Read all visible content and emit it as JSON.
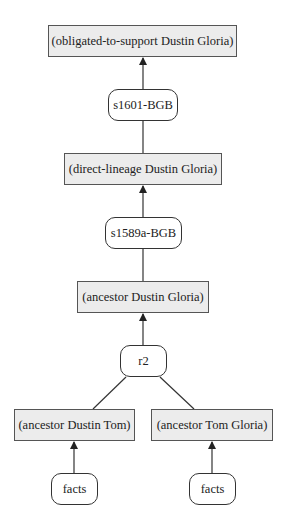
{
  "diagram": {
    "type": "argument-graph",
    "nodes": [
      {
        "id": "n1",
        "label": "(obligated-to-support Dustin Gloria)",
        "kind": "statement"
      },
      {
        "id": "n2",
        "label": "s1601-BGB",
        "kind": "rule"
      },
      {
        "id": "n3",
        "label": "(direct-lineage Dustin Gloria)",
        "kind": "statement"
      },
      {
        "id": "n4",
        "label": "s1589a-BGB",
        "kind": "rule"
      },
      {
        "id": "n5",
        "label": "(ancestor Dustin Gloria)",
        "kind": "statement"
      },
      {
        "id": "n6",
        "label": "r2",
        "kind": "rule"
      },
      {
        "id": "n7",
        "label": "(ancestor Dustin Tom)",
        "kind": "statement"
      },
      {
        "id": "n8",
        "label": "(ancestor Tom Gloria)",
        "kind": "statement"
      },
      {
        "id": "n9",
        "label": "facts",
        "kind": "rule"
      },
      {
        "id": "n10",
        "label": "facts",
        "kind": "rule"
      }
    ],
    "edges": [
      {
        "from": "n2",
        "to": "n1",
        "arrow": true
      },
      {
        "from": "n3",
        "to": "n2",
        "arrow": false
      },
      {
        "from": "n4",
        "to": "n3",
        "arrow": true
      },
      {
        "from": "n5",
        "to": "n4",
        "arrow": false
      },
      {
        "from": "n6",
        "to": "n5",
        "arrow": true
      },
      {
        "from": "n7",
        "to": "n6",
        "arrow": false
      },
      {
        "from": "n8",
        "to": "n6",
        "arrow": false
      },
      {
        "from": "n9",
        "to": "n7",
        "arrow": true
      },
      {
        "from": "n10",
        "to": "n8",
        "arrow": true
      }
    ],
    "colors": {
      "statement_fill": "#ececec",
      "statement_border": "#555555",
      "rule_fill": "#ffffff",
      "edge": "#333333"
    }
  }
}
